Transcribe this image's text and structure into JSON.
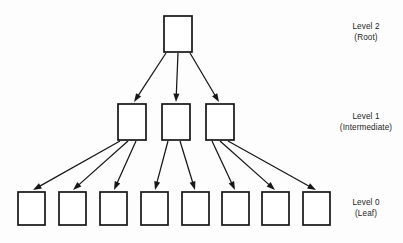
{
  "diagram": {
    "type": "tree",
    "levels": [
      {
        "id": "level-2",
        "title": "Level 2",
        "subtitle": "(Root)",
        "node_count": 1
      },
      {
        "id": "level-1",
        "title": "Level 1",
        "subtitle": "(Intermediate)",
        "node_count": 3
      },
      {
        "id": "level-0",
        "title": "Level 0",
        "subtitle": "(Leaf)",
        "node_count": 8
      }
    ],
    "colors": {
      "stroke": "#161616",
      "node_fill": "#ffffff",
      "background": "#fdfdfd",
      "text": "#1d1d1d"
    },
    "nodes": {
      "root": [
        {
          "id": "root-1",
          "x": 164,
          "y": 16,
          "w": 28,
          "h": 36
        }
      ],
      "intermediate": [
        {
          "id": "mid-1",
          "x": 118,
          "y": 104,
          "w": 28,
          "h": 36
        },
        {
          "id": "mid-2",
          "x": 162,
          "y": 104,
          "w": 28,
          "h": 36
        },
        {
          "id": "mid-3",
          "x": 206,
          "y": 104,
          "w": 28,
          "h": 36
        }
      ],
      "leaf": [
        {
          "id": "leaf-1",
          "x": 18,
          "y": 192,
          "w": 27,
          "h": 33
        },
        {
          "id": "leaf-2",
          "x": 59,
          "y": 192,
          "w": 27,
          "h": 33
        },
        {
          "id": "leaf-3",
          "x": 100,
          "y": 192,
          "w": 27,
          "h": 33
        },
        {
          "id": "leaf-4",
          "x": 141,
          "y": 192,
          "w": 27,
          "h": 33
        },
        {
          "id": "leaf-5",
          "x": 182,
          "y": 192,
          "w": 27,
          "h": 33
        },
        {
          "id": "leaf-6",
          "x": 222,
          "y": 192,
          "w": 27,
          "h": 33
        },
        {
          "id": "leaf-7",
          "x": 262,
          "y": 192,
          "w": 27,
          "h": 33
        },
        {
          "id": "leaf-8",
          "x": 303,
          "y": 192,
          "w": 27,
          "h": 33
        }
      ]
    },
    "edges": [
      {
        "from": "root-1",
        "to": "mid-1",
        "x1": 166,
        "y1": 53,
        "x2": 134,
        "y2": 102
      },
      {
        "from": "root-1",
        "to": "mid-2",
        "x1": 178,
        "y1": 53,
        "x2": 176,
        "y2": 102
      },
      {
        "from": "root-1",
        "to": "mid-3",
        "x1": 190,
        "y1": 53,
        "x2": 219,
        "y2": 102
      },
      {
        "from": "mid-1",
        "to": "leaf-1",
        "x1": 120,
        "y1": 141,
        "x2": 33,
        "y2": 190
      },
      {
        "from": "mid-1",
        "to": "leaf-2",
        "x1": 128,
        "y1": 141,
        "x2": 73,
        "y2": 190
      },
      {
        "from": "mid-1",
        "to": "leaf-3",
        "x1": 136,
        "y1": 141,
        "x2": 114,
        "y2": 190
      },
      {
        "from": "mid-2",
        "to": "leaf-4",
        "x1": 168,
        "y1": 141,
        "x2": 155,
        "y2": 190
      },
      {
        "from": "mid-2",
        "to": "leaf-5",
        "x1": 180,
        "y1": 141,
        "x2": 195,
        "y2": 190
      },
      {
        "from": "mid-3",
        "to": "leaf-6",
        "x1": 212,
        "y1": 141,
        "x2": 235,
        "y2": 190
      },
      {
        "from": "mid-3",
        "to": "leaf-7",
        "x1": 220,
        "y1": 141,
        "x2": 275,
        "y2": 190
      },
      {
        "from": "mid-3",
        "to": "leaf-8",
        "x1": 228,
        "y1": 141,
        "x2": 316,
        "y2": 190
      }
    ]
  }
}
